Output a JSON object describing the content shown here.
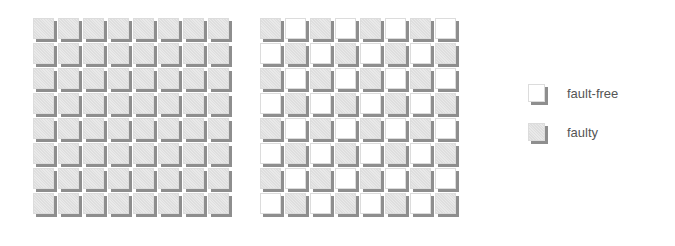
{
  "colors": {
    "faulty": "#e4e4e4",
    "fault_free": "#ffffff",
    "shadow": "#8e8e8e"
  },
  "grids": [
    {
      "name": "all-faulty-array",
      "rows": 8,
      "cols": 8,
      "pattern": "all-faulty",
      "cells": [
        [
          "faulty",
          "faulty",
          "faulty",
          "faulty",
          "faulty",
          "faulty",
          "faulty",
          "faulty"
        ],
        [
          "faulty",
          "faulty",
          "faulty",
          "faulty",
          "faulty",
          "faulty",
          "faulty",
          "faulty"
        ],
        [
          "faulty",
          "faulty",
          "faulty",
          "faulty",
          "faulty",
          "faulty",
          "faulty",
          "faulty"
        ],
        [
          "faulty",
          "faulty",
          "faulty",
          "faulty",
          "faulty",
          "faulty",
          "faulty",
          "faulty"
        ],
        [
          "faulty",
          "faulty",
          "faulty",
          "faulty",
          "faulty",
          "faulty",
          "faulty",
          "faulty"
        ],
        [
          "faulty",
          "faulty",
          "faulty",
          "faulty",
          "faulty",
          "faulty",
          "faulty",
          "faulty"
        ],
        [
          "faulty",
          "faulty",
          "faulty",
          "faulty",
          "faulty",
          "faulty",
          "faulty",
          "faulty"
        ],
        [
          "faulty",
          "faulty",
          "faulty",
          "faulty",
          "faulty",
          "faulty",
          "faulty",
          "faulty"
        ]
      ]
    },
    {
      "name": "checkerboard-array",
      "rows": 8,
      "cols": 8,
      "pattern": "checkerboard",
      "cells": [
        [
          "faulty",
          "fault-free",
          "faulty",
          "fault-free",
          "faulty",
          "fault-free",
          "faulty",
          "fault-free"
        ],
        [
          "fault-free",
          "faulty",
          "fault-free",
          "faulty",
          "fault-free",
          "faulty",
          "fault-free",
          "faulty"
        ],
        [
          "faulty",
          "fault-free",
          "faulty",
          "fault-free",
          "faulty",
          "fault-free",
          "faulty",
          "fault-free"
        ],
        [
          "fault-free",
          "faulty",
          "fault-free",
          "faulty",
          "fault-free",
          "faulty",
          "fault-free",
          "faulty"
        ],
        [
          "faulty",
          "fault-free",
          "faulty",
          "fault-free",
          "faulty",
          "fault-free",
          "faulty",
          "fault-free"
        ],
        [
          "fault-free",
          "faulty",
          "fault-free",
          "faulty",
          "fault-free",
          "faulty",
          "fault-free",
          "faulty"
        ],
        [
          "faulty",
          "fault-free",
          "faulty",
          "fault-free",
          "faulty",
          "fault-free",
          "faulty",
          "fault-free"
        ],
        [
          "fault-free",
          "faulty",
          "fault-free",
          "faulty",
          "fault-free",
          "faulty",
          "fault-free",
          "faulty"
        ]
      ]
    }
  ],
  "legend": {
    "items": [
      {
        "state": "fault-free",
        "label": "fault-free"
      },
      {
        "state": "faulty",
        "label": "faulty"
      }
    ]
  }
}
